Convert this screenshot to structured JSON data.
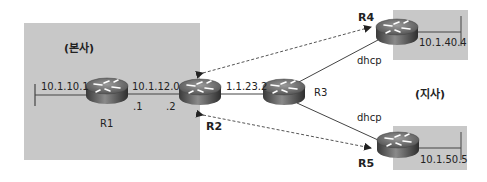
{
  "zones": {
    "hq": {
      "label": "(본사)",
      "x": 24,
      "y": 23,
      "w": 176,
      "h": 137
    },
    "branch_r4": {
      "x": 393,
      "y": 10,
      "w": 75,
      "h": 50
    },
    "branch_r5": {
      "x": 393,
      "y": 126,
      "w": 74,
      "h": 44
    },
    "branch_label": "(지사)"
  },
  "routers": [
    {
      "id": "R1",
      "label": "R1",
      "x": 85,
      "y": 77
    },
    {
      "id": "R2",
      "label": "R2",
      "x": 178,
      "y": 78
    },
    {
      "id": "R3",
      "label": "R3",
      "x": 262,
      "y": 78
    },
    {
      "id": "R4",
      "label": "R4",
      "x": 375,
      "y": 18
    },
    {
      "id": "R5",
      "label": "R5",
      "x": 376,
      "y": 131
    }
  ],
  "labels": {
    "r1_lan": "10.1.10.1",
    "r1_r2_net": "10.1.12.0",
    "r1_if": ".1",
    "r2_if": ".2",
    "r2_r3_addr": "1.1.23.2",
    "r3_r4_link": "dhcp",
    "r3_r5_link": "dhcp",
    "r4_lan": "10.1.40.4",
    "r5_lan": "10.1.50.5"
  },
  "colors": {
    "zone_fill": "#c8c8c8",
    "link": "#444444",
    "tunnel": "#555555"
  }
}
